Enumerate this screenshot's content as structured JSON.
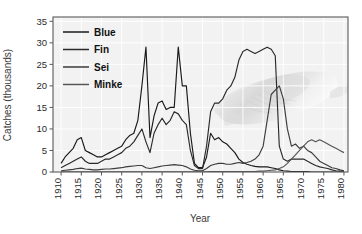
{
  "chart_data": {
    "type": "line",
    "title": "",
    "xlabel": "Year",
    "ylabel": "Catches (thousands)",
    "xlim": [
      1908,
      1981
    ],
    "ylim": [
      0,
      36
    ],
    "xticks": [
      1910,
      1915,
      1920,
      1925,
      1930,
      1935,
      1940,
      1945,
      1950,
      1955,
      1960,
      1965,
      1970,
      1975,
      1980
    ],
    "yticks": [
      0,
      5,
      10,
      15,
      20,
      25,
      30,
      35
    ],
    "grid": true,
    "legend_position": "top-left",
    "background_watermark": "whale-illustration",
    "x": [
      1910,
      1911,
      1912,
      1913,
      1914,
      1915,
      1916,
      1917,
      1918,
      1919,
      1920,
      1921,
      1922,
      1923,
      1924,
      1925,
      1926,
      1927,
      1928,
      1929,
      1930,
      1931,
      1932,
      1933,
      1934,
      1935,
      1936,
      1937,
      1938,
      1939,
      1940,
      1941,
      1942,
      1943,
      1944,
      1945,
      1946,
      1947,
      1948,
      1949,
      1950,
      1951,
      1952,
      1953,
      1954,
      1955,
      1956,
      1957,
      1958,
      1959,
      1960,
      1961,
      1962,
      1963,
      1964,
      1965,
      1966,
      1967,
      1968,
      1969,
      1970,
      1971,
      1972,
      1973,
      1974,
      1975,
      1976,
      1977,
      1978,
      1979,
      1980
    ],
    "series": [
      {
        "name": "Blue",
        "color": "#1a1a1a",
        "values": [
          2.0,
          3.5,
          4.5,
          5.5,
          7.5,
          8.0,
          5.0,
          4.5,
          4.0,
          3.5,
          3.5,
          4.0,
          4.5,
          5.0,
          5.5,
          6.0,
          7.5,
          8.5,
          9.0,
          12.0,
          20.0,
          29.0,
          8.0,
          13.0,
          16.0,
          16.5,
          14.5,
          15.0,
          15.0,
          29.0,
          20.0,
          20.0,
          9.0,
          2.0,
          1.0,
          1.0,
          3.5,
          9.0,
          7.5,
          8.0,
          7.0,
          6.5,
          5.5,
          4.5,
          3.0,
          2.2,
          1.8,
          1.5,
          1.3,
          1.2,
          1.2,
          1.2,
          1.0,
          0.8,
          0.5,
          0.3,
          0.2,
          0.1,
          0.1,
          0.1,
          0.1,
          0.1,
          0.0,
          0.0,
          0.0,
          0.0,
          0.0,
          0.0,
          0.0,
          0.0,
          0.0
        ]
      },
      {
        "name": "Fin",
        "color": "#2a2a2a",
        "values": [
          1.0,
          1.5,
          2.0,
          2.5,
          3.0,
          3.5,
          2.5,
          2.0,
          2.0,
          2.0,
          2.5,
          3.0,
          3.0,
          3.5,
          4.0,
          4.5,
          5.5,
          6.0,
          7.0,
          8.5,
          10.0,
          7.0,
          4.5,
          9.0,
          11.0,
          12.5,
          11.0,
          12.0,
          14.0,
          13.5,
          12.0,
          11.0,
          5.0,
          1.5,
          0.8,
          0.8,
          6.0,
          14.0,
          16.0,
          16.0,
          17.0,
          19.0,
          20.0,
          22.0,
          26.0,
          28.0,
          28.5,
          28.0,
          27.5,
          28.0,
          28.5,
          29.0,
          28.5,
          27.0,
          6.0,
          3.0,
          2.5,
          3.0,
          3.0,
          3.0,
          3.0,
          2.5,
          2.0,
          1.5,
          1.2,
          1.0,
          0.8,
          0.5,
          0.3,
          0.2,
          0.2
        ]
      },
      {
        "name": "Sei",
        "color": "#3d3d3d",
        "values": [
          0.3,
          0.4,
          0.5,
          0.6,
          0.8,
          0.9,
          0.7,
          0.6,
          0.5,
          0.5,
          0.6,
          0.7,
          0.7,
          0.8,
          0.9,
          1.0,
          1.2,
          1.3,
          1.4,
          1.5,
          1.5,
          1.0,
          0.8,
          1.0,
          1.2,
          1.4,
          1.5,
          1.6,
          1.7,
          1.6,
          1.5,
          1.2,
          0.7,
          0.4,
          0.3,
          0.3,
          0.8,
          1.5,
          1.8,
          2.0,
          2.0,
          1.8,
          1.8,
          2.0,
          2.2,
          2.0,
          2.2,
          2.5,
          3.0,
          4.0,
          6.0,
          12.0,
          18.0,
          19.0,
          20.0,
          17.0,
          10.0,
          6.0,
          6.5,
          5.5,
          6.0,
          5.0,
          4.5,
          3.5,
          2.5,
          2.0,
          1.5,
          1.0,
          0.8,
          0.5,
          0.3
        ]
      },
      {
        "name": "Minke",
        "color": "#555555",
        "values": [
          0.05,
          0.05,
          0.05,
          0.05,
          0.05,
          0.05,
          0.05,
          0.05,
          0.05,
          0.05,
          0.05,
          0.05,
          0.05,
          0.05,
          0.05,
          0.05,
          0.05,
          0.05,
          0.05,
          0.05,
          0.05,
          0.05,
          0.05,
          0.05,
          0.05,
          0.05,
          0.05,
          0.05,
          0.05,
          0.05,
          0.05,
          0.05,
          0.05,
          0.05,
          0.05,
          0.05,
          0.05,
          0.1,
          0.1,
          0.1,
          0.1,
          0.1,
          0.1,
          0.1,
          0.1,
          0.1,
          0.1,
          0.1,
          0.1,
          0.2,
          0.2,
          0.3,
          0.4,
          0.5,
          0.8,
          1.2,
          2.0,
          3.0,
          4.0,
          5.0,
          6.0,
          7.0,
          7.5,
          7.0,
          7.5,
          7.0,
          6.5,
          6.0,
          5.5,
          5.0,
          4.5
        ]
      }
    ]
  },
  "legend": {
    "items": [
      {
        "label": "Blue"
      },
      {
        "label": "Fin"
      },
      {
        "label": "Sei"
      },
      {
        "label": "Minke"
      }
    ]
  },
  "axes": {
    "x_title": "Year",
    "y_title": "Catches (thousands)"
  }
}
